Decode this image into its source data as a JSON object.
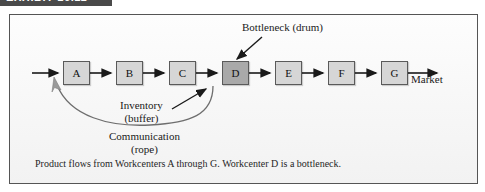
{
  "exhibit": {
    "bar_label": "EXHIBIT 16.11"
  },
  "figure": {
    "workcenters": [
      {
        "id": "A",
        "label": "A",
        "bottleneck": false
      },
      {
        "id": "B",
        "label": "B",
        "bottleneck": false
      },
      {
        "id": "C",
        "label": "C",
        "bottleneck": false
      },
      {
        "id": "D",
        "label": "D",
        "bottleneck": true
      },
      {
        "id": "E",
        "label": "E",
        "bottleneck": false
      },
      {
        "id": "F",
        "label": "F",
        "bottleneck": false
      },
      {
        "id": "G",
        "label": "G",
        "bottleneck": false
      }
    ],
    "annotations": {
      "bottleneck": "Bottleneck (drum)",
      "market": "Market",
      "inventory_line1": "Inventory",
      "inventory_line2": "(buffer)",
      "communication_line1": "Communication",
      "communication_line2": "(rope)"
    },
    "caption": "Product flows from Workcenters A through G. Workcenter D is a bottleneck.",
    "colors": {
      "box_fill": "#d6d6d6",
      "bottleneck_fill": "#a9a9a9",
      "box_stroke": "#5a5a5a",
      "panel_bg": "#fbfbfb",
      "panel_border": "#555555",
      "header_bar": "#4a4a4a",
      "arrow": "#1a1a1a",
      "rope": "#6e6e6e"
    }
  }
}
